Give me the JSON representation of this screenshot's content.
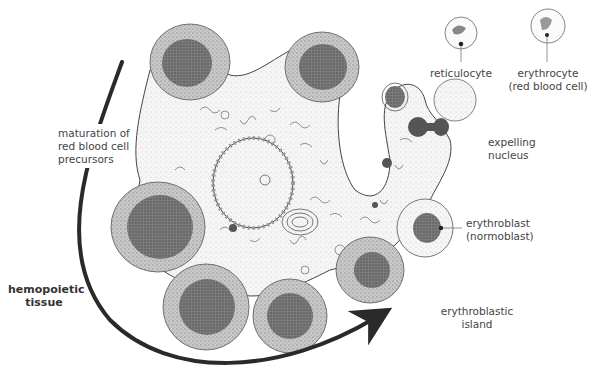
{
  "figure": {
    "type": "histology illustration",
    "arrow_label": "maturation of red blood cell precursors"
  },
  "labels": {
    "maturation_line1": "maturation of",
    "maturation_line2": "red blood cell",
    "maturation_line3": "precursors",
    "hemopoietic_line1": "hemopoietic",
    "hemopoietic_line2": "tissue",
    "reticulocyte": "reticulocyte",
    "erythrocyte_line1": "erythrocyte",
    "erythrocyte_line2": "(red blood cell)",
    "expelling_line1": "expelling",
    "expelling_line2": "nucleus",
    "erythroblast_line1": "erythroblast",
    "erythroblast_line2": "(normoblast)",
    "island_line1": "erythroblastic",
    "island_line2": "island"
  },
  "colors": {
    "ink": "#333333",
    "nucleus": "#6b6b6b",
    "cytoplasm": "#bdbdbd",
    "macrophage": "#f4f4f4",
    "background": "#ffffff"
  }
}
